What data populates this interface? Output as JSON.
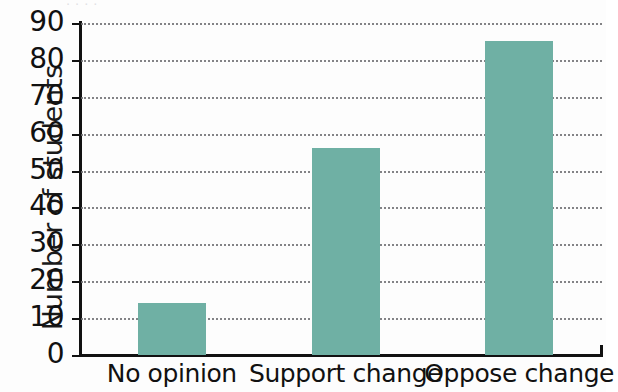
{
  "cropped_title_remnant": "·            ·              ·  ·",
  "chart_data": {
    "type": "bar",
    "title": "",
    "xlabel": "",
    "ylabel": "Number of students",
    "categories": [
      "No opinion",
      "Support change",
      "Oppose change"
    ],
    "values": [
      14,
      56,
      85
    ],
    "ylim": [
      0,
      90
    ],
    "ytick_labels": [
      "0",
      "10",
      "20",
      "30",
      "40",
      "50",
      "60",
      "70",
      "80",
      "90"
    ],
    "ytick_values": [
      0,
      10,
      20,
      30,
      40,
      50,
      60,
      70,
      80,
      90
    ],
    "grid": true,
    "grid_style": "dotted-horizontal",
    "legend": false,
    "legend_position": "none",
    "bar_color": "#6fb0a4",
    "axis_color": "#111111",
    "gridline_color": "#6e6e72",
    "background_color": "#fdfdfd"
  }
}
